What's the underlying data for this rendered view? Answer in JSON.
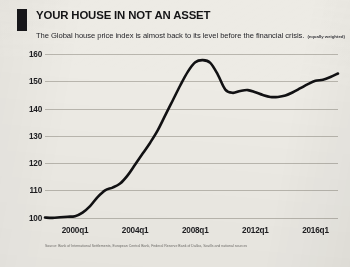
{
  "header": {
    "title": "YOUR HOUSE IN NOT AN ASSET",
    "subtitle": "The Global house price index is almost back to its level before the financial crisis.",
    "subtitle_note": "(equally weighted)",
    "accent_color": "#17171a"
  },
  "source": {
    "text": "Source: Bank of International Settlements, European Central Bank, Federal Reserve Bank of Dallas, Savills and national sources"
  },
  "chart_data": {
    "type": "line",
    "title": "YOUR HOUSE IN NOT AN ASSET",
    "subtitle": "The Global house price index is almost back to its level before the financial crisis. (equally weighted)",
    "xlabel": "",
    "ylabel": "",
    "ylim": [
      98,
      163
    ],
    "xlim": [
      "2000q1",
      "2017q3"
    ],
    "grid": true,
    "legend": false,
    "line_color": "#111113",
    "line_width_px": 2.6,
    "background_color": "#edebe5",
    "gridline_color": "#b9b6ae",
    "yticks": [
      100,
      110,
      120,
      130,
      140,
      150,
      160
    ],
    "ytick_labels": [
      "100",
      "110",
      "120",
      "130",
      "140",
      "150",
      "160"
    ],
    "xticks": [
      "2000q1",
      "2004q1",
      "2008q1",
      "2012q1",
      "2016q1"
    ],
    "xtick_labels": [
      "2000q1",
      "2004q1",
      "2008q1",
      "2012q1",
      "2016q1"
    ],
    "series": [
      {
        "name": "Global house price index (equally weighted)",
        "x": [
          "1998q1",
          "1998q3",
          "1999q1",
          "1999q3",
          "2000q1",
          "2000q3",
          "2001q1",
          "2001q3",
          "2002q1",
          "2002q3",
          "2003q1",
          "2003q3",
          "2004q1",
          "2004q3",
          "2005q1",
          "2005q3",
          "2006q1",
          "2006q3",
          "2007q1",
          "2007q3",
          "2008q1",
          "2008q3",
          "2009q1",
          "2009q3",
          "2010q1",
          "2010q3",
          "2011q1",
          "2011q3",
          "2012q1",
          "2012q3",
          "2013q1",
          "2013q3",
          "2014q1",
          "2014q3",
          "2015q1",
          "2015q3",
          "2016q1",
          "2016q3",
          "2017q1",
          "2017q3"
        ],
        "values": [
          100.0,
          99.9,
          100.1,
          100.3,
          100.5,
          101.8,
          104.2,
          107.5,
          110.0,
          111.0,
          112.5,
          115.5,
          119.5,
          123.5,
          127.5,
          132.0,
          137.5,
          143.0,
          148.5,
          153.5,
          157.0,
          157.8,
          156.8,
          152.5,
          147.0,
          145.8,
          146.5,
          146.8,
          146.0,
          145.0,
          144.3,
          144.3,
          144.8,
          146.0,
          147.5,
          149.0,
          150.2,
          150.6,
          151.6,
          152.9
        ]
      }
    ],
    "annotations": []
  }
}
